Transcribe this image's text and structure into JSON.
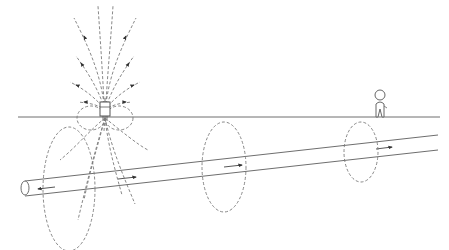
{
  "diagram": {
    "title": "",
    "colors": {
      "line": "#6e6e6e",
      "dashed_field": "#7a7a7a",
      "arrow": "#333333",
      "background": "#ffffff"
    },
    "elements": {
      "ground_line": {
        "label": ""
      },
      "transmitter": {
        "label": ""
      },
      "buried_pipe": {
        "label": ""
      },
      "field_ellipses": [
        {
          "id": "near",
          "label": ""
        },
        {
          "id": "middle",
          "label": ""
        },
        {
          "id": "far",
          "label": ""
        }
      ],
      "operator": {
        "label": ""
      },
      "current_arrows": [
        {
          "direction": "left",
          "label": ""
        },
        {
          "direction": "right",
          "label": ""
        },
        {
          "direction": "right",
          "label": ""
        },
        {
          "direction": "right",
          "label": ""
        }
      ]
    }
  }
}
